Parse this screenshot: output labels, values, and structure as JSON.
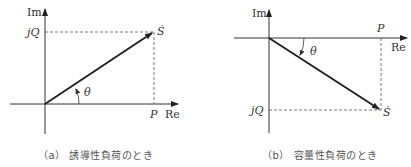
{
  "diagram_a": {
    "axis_im_label": "Im",
    "axis_re_label": "Re",
    "q_label": "jQ",
    "p_label": "P",
    "s_label": "Ṡ",
    "angle_label": "θ",
    "caption": "（a） 誘導性負荷のとき"
  },
  "diagram_b": {
    "axis_im_label": "Im",
    "axis_re_label": "Re",
    "q_label": "jQ",
    "p_label": "P",
    "s_label": "Ṡ",
    "angle_label": "θ",
    "caption": "（b） 容量性負荷のとき"
  },
  "colors": {
    "line": "#222222",
    "dashed": "#555555",
    "text": "#333333"
  }
}
